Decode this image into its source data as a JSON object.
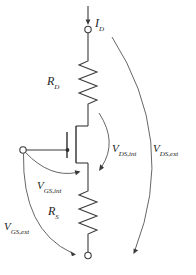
{
  "diagram": {
    "type": "circuit-schematic",
    "canvas": {
      "width": 196,
      "height": 275
    },
    "ink_color": "#3a3a3a",
    "arc_color": "#555555",
    "background": "#ffffff",
    "labels": {
      "drain_current": {
        "symbol": "I",
        "subscript": "D",
        "text": "I_D"
      },
      "drain_resistor": {
        "symbol": "R",
        "subscript": "D",
        "text": "R_D"
      },
      "source_resistor": {
        "symbol": "R",
        "subscript": "S",
        "text": "R_S"
      },
      "vds_internal": {
        "symbol": "V",
        "subscript": "DS,int",
        "text": "V_DS,int"
      },
      "vds_external": {
        "symbol": "V",
        "subscript": "DS,ext",
        "text": "V_DS,ext"
      },
      "vgs_internal": {
        "symbol": "V",
        "subscript": "GS,int",
        "text": "V_GS,int"
      },
      "vgs_external": {
        "symbol": "V",
        "subscript": "GS,ext",
        "text": "V_GS,ext"
      }
    },
    "terminals": [
      {
        "name": "drain-terminal",
        "x": 88,
        "y": 28
      },
      {
        "name": "gate-terminal",
        "x": 23,
        "y": 150
      },
      {
        "name": "source-terminal",
        "x": 88,
        "y": 256
      }
    ],
    "components": [
      {
        "name": "drain-resistor",
        "label": "R_D",
        "orientation": "vertical"
      },
      {
        "name": "mosfet",
        "label": "",
        "orientation": "vertical"
      },
      {
        "name": "source-resistor",
        "label": "R_S",
        "orientation": "vertical"
      }
    ]
  }
}
